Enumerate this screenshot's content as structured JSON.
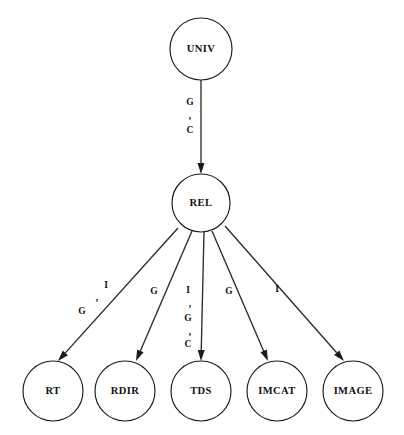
{
  "diagram": {
    "type": "directed-tree",
    "background_color": "#ffffff",
    "stroke_color": "#1a1a1a",
    "text_color": "#111111",
    "nodes": [
      {
        "id": "univ",
        "label": "UNIV",
        "cx": 201,
        "cy": 49,
        "r": 31
      },
      {
        "id": "rel",
        "label": "REL",
        "cx": 201,
        "cy": 203,
        "r": 29
      },
      {
        "id": "rt",
        "label": "RT",
        "cx": 53,
        "cy": 391,
        "r": 30
      },
      {
        "id": "rdir",
        "label": "RDIR",
        "cx": 125,
        "cy": 391,
        "r": 30
      },
      {
        "id": "tds",
        "label": "TDS",
        "cx": 201,
        "cy": 391,
        "r": 30
      },
      {
        "id": "imcat",
        "label": "IMCAT",
        "cx": 277,
        "cy": 391,
        "r": 30
      },
      {
        "id": "image",
        "label": "IMAGE",
        "cx": 353,
        "cy": 391,
        "r": 30
      }
    ],
    "edges": [
      {
        "id": "univ-rel",
        "from": "univ",
        "to": "rel",
        "x1": 201,
        "y1": 80,
        "x2": 201,
        "y2": 174,
        "label_tokens": [
          "G",
          ",",
          "C"
        ],
        "label_layout": "vertical",
        "label_points": [
          {
            "t": "G",
            "x": 190,
            "y": 103
          },
          {
            "t": ",",
            "x": 190,
            "y": 117
          },
          {
            "t": "C",
            "x": 190,
            "y": 131
          }
        ]
      },
      {
        "id": "rel-rt",
        "from": "rel",
        "to": "rt",
        "x1": 178,
        "y1": 228,
        "x2": 58,
        "y2": 361,
        "label_tokens": [
          "G",
          ",",
          "I"
        ],
        "label_layout": "diagonal",
        "label_points": [
          {
            "t": "G",
            "x": 82,
            "y": 312
          },
          {
            "t": ",",
            "x": 97,
            "y": 299
          },
          {
            "t": "I",
            "x": 106,
            "y": 286
          }
        ]
      },
      {
        "id": "rel-rdir",
        "from": "rel",
        "to": "rdir",
        "x1": 192,
        "y1": 231,
        "x2": 136,
        "y2": 361,
        "label_tokens": [
          "G"
        ],
        "label_layout": "single",
        "label_points": [
          {
            "t": "G",
            "x": 154,
            "y": 292
          }
        ]
      },
      {
        "id": "rel-tds",
        "from": "rel",
        "to": "tds",
        "x1": 204,
        "y1": 232,
        "x2": 201,
        "y2": 361,
        "label_tokens": [
          "I",
          ",",
          "G",
          ",",
          "C"
        ],
        "label_layout": "vertical",
        "label_points": [
          {
            "t": "I",
            "x": 188,
            "y": 291
          },
          {
            "t": ",",
            "x": 190,
            "y": 305
          },
          {
            "t": "G",
            "x": 188,
            "y": 319
          },
          {
            "t": ",",
            "x": 190,
            "y": 333
          },
          {
            "t": "C",
            "x": 188,
            "y": 345
          }
        ]
      },
      {
        "id": "rel-imcat",
        "from": "rel",
        "to": "imcat",
        "x1": 212,
        "y1": 231,
        "x2": 268,
        "y2": 361,
        "label_tokens": [
          "G"
        ],
        "label_layout": "single",
        "label_points": [
          {
            "t": "G",
            "x": 229,
            "y": 292
          }
        ]
      },
      {
        "id": "rel-image",
        "from": "rel",
        "to": "image",
        "x1": 225,
        "y1": 226,
        "x2": 344,
        "y2": 361,
        "label_tokens": [
          "I"
        ],
        "label_layout": "single",
        "label_points": [
          {
            "t": "I",
            "x": 277,
            "y": 290
          }
        ]
      }
    ]
  }
}
